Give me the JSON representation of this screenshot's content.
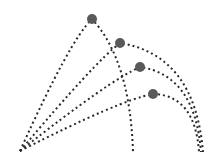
{
  "diagram": {
    "trajectories": [
      {
        "id": "trajectory-1",
        "apex_label": ""
      },
      {
        "id": "trajectory-2",
        "apex_label": ""
      },
      {
        "id": "trajectory-3",
        "apex_label": ""
      },
      {
        "id": "trajectory-4",
        "apex_label": ""
      }
    ],
    "colors": {
      "line": "#2a2a2a",
      "apex": "#5a5a5a",
      "background": "#ffffff"
    }
  }
}
